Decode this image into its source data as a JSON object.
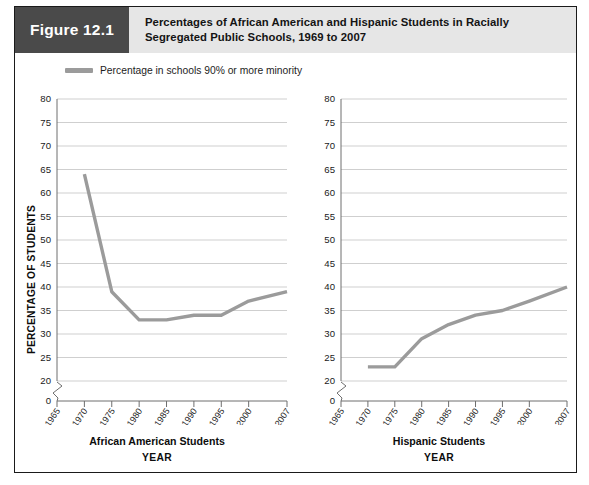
{
  "figure": {
    "tag": "Figure 12.1",
    "title_line1": "Percentages of African American and Hispanic Students in Racially",
    "title_line2": "Segregated Public Schools, 1969 to 2007"
  },
  "legend": {
    "label": "Percentage in schools 90% or more minority",
    "swatch_color": "#9b9b9b"
  },
  "axis": {
    "ylabel": "PERCENTAGE OF STUDENTS",
    "xlabel": "YEAR"
  },
  "panels": {
    "left_title": "African American Students",
    "right_title": "Hispanic Students"
  },
  "colors": {
    "line": "#9b9b9b",
    "grid": "#c9c9c9",
    "axis": "#6e6e6e",
    "tag_bg": "#4a4a4a",
    "title_bg": "#e6e6e6",
    "frame": "#1a1a1a"
  },
  "chart_data": [
    {
      "type": "line",
      "title": "African American Students",
      "xlabel": "YEAR",
      "ylabel": "PERCENTAGE OF STUDENTS",
      "series_name": "Percentage in schools 90% or more minority",
      "x": [
        1970,
        1975,
        1980,
        1985,
        1990,
        1995,
        2000,
        2007
      ],
      "values": [
        64,
        39,
        33,
        33,
        34,
        34,
        37,
        39
      ],
      "xticks": [
        1965,
        1970,
        1975,
        1980,
        1985,
        1990,
        1995,
        2000,
        2007
      ],
      "yticks": [
        0,
        20,
        25,
        30,
        35,
        40,
        45,
        50,
        55,
        60,
        65,
        70,
        75,
        80
      ],
      "ylim": [
        0,
        80
      ],
      "y_axis_break": true,
      "grid": "horizontal",
      "legend_position": "above-left"
    },
    {
      "type": "line",
      "title": "Hispanic Students",
      "xlabel": "YEAR",
      "ylabel": "PERCENTAGE OF STUDENTS",
      "series_name": "Percentage in schools 90% or more minority",
      "x": [
        1970,
        1975,
        1980,
        1985,
        1990,
        1995,
        2000,
        2007
      ],
      "values": [
        23,
        23,
        29,
        32,
        34,
        35,
        37,
        40
      ],
      "xticks": [
        1965,
        1970,
        1975,
        1980,
        1985,
        1990,
        1995,
        2000,
        2007
      ],
      "yticks": [
        0,
        20,
        25,
        30,
        35,
        40,
        45,
        50,
        55,
        60,
        65,
        70,
        75,
        80
      ],
      "ylim": [
        0,
        80
      ],
      "y_axis_break": true,
      "grid": "horizontal",
      "legend_position": "above-left"
    }
  ]
}
